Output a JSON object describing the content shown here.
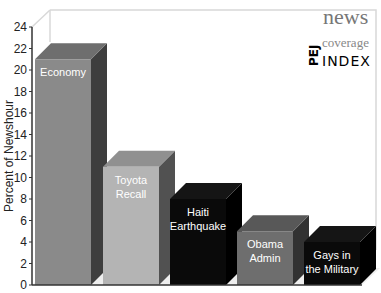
{
  "chart_data": {
    "type": "bar",
    "title": "",
    "xlabel": "",
    "ylabel": "Percent of Newshour",
    "ylim": [
      0,
      24
    ],
    "yticks": [
      0,
      2,
      4,
      6,
      8,
      10,
      12,
      14,
      16,
      18,
      20,
      22,
      24
    ],
    "grid": false,
    "three_d": true,
    "categories": [
      "Economy",
      "Toyota Recall",
      "Haiti Earthquake",
      "Obama Admin",
      "Gays in the Military"
    ],
    "values": [
      21,
      11,
      8,
      5,
      4
    ],
    "bar_colors": [
      "#8a8a8a",
      "#b4b4b4",
      "#0a0a0a",
      "#6e6e6e",
      "#0a0a0a"
    ],
    "labels_in_bars": [
      [
        "Economy"
      ],
      [
        "Toyota",
        "Recall"
      ],
      [
        "Haiti",
        "Earthquake"
      ],
      [
        "Obama",
        "Admin"
      ],
      [
        "Gays in",
        "the Military"
      ]
    ]
  },
  "logo": {
    "line1": "news",
    "line2": "coverage",
    "line3": "INDEX",
    "vertical": "PEJ"
  }
}
